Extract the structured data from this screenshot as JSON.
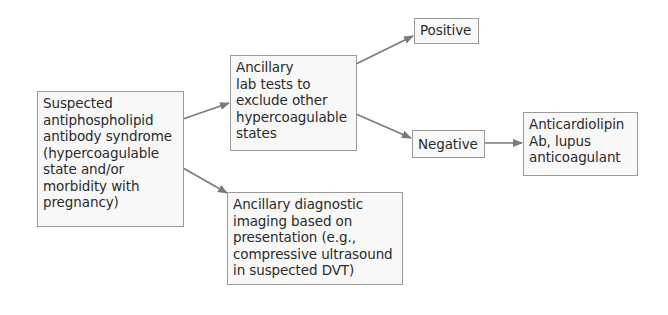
{
  "nodes": {
    "suspected": {
      "label": "Suspected\nantiphospholipid\nantibody syndrome\n(hypercoagulable\nstate and/or\nmorbidity with\npregnancy)"
    },
    "lab_tests": {
      "label": "Ancillary\nlab tests to\nexclude other\nhypercoagulable\nstates"
    },
    "positive": {
      "label": "Positive"
    },
    "negative": {
      "label": "Negative"
    },
    "anticardiolipin": {
      "label": "Anticardiolipin\nAb, lupus\nanticoagulant"
    },
    "imaging": {
      "label": "Ancillary diagnostic\nimaging based on\npresentation (e.g.,\ncompressive ultrasound\nin suspected DVT)"
    }
  },
  "edges": [
    {
      "from": "suspected",
      "to": "lab_tests"
    },
    {
      "from": "suspected",
      "to": "imaging"
    },
    {
      "from": "lab_tests",
      "to": "positive"
    },
    {
      "from": "lab_tests",
      "to": "negative"
    },
    {
      "from": "negative",
      "to": "anticardiolipin"
    }
  ],
  "colors": {
    "border": "#9a9a9a",
    "fill": "#f8f8f8",
    "arrow": "#7a7a7a",
    "text": "#2a2a2a"
  }
}
